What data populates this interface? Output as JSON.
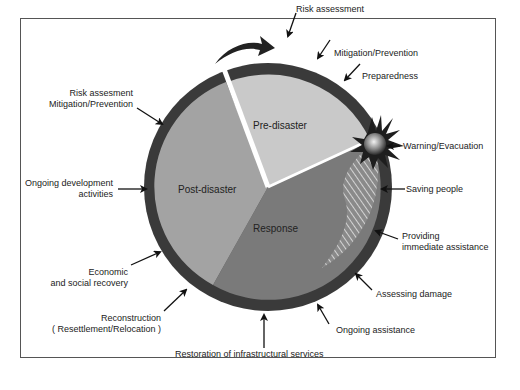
{
  "diagram": {
    "segments": [
      {
        "name": "pre-disaster",
        "label": "Pre-disaster",
        "color": "#c9c9c9"
      },
      {
        "name": "response",
        "label": "Response",
        "color": "#7a7a7a"
      },
      {
        "name": "post-disaster",
        "label": "Post-disaster",
        "color": "#a3a3a3"
      }
    ],
    "ring_color": "#3a3a3a",
    "labels": {
      "risk_assessment": "Risk assessment",
      "mitigation_prevention": "Mitigation/Prevention",
      "preparedness": "Preparedness",
      "warning_evacuation": "Warning/Evacuation",
      "saving_people": "Saving people",
      "providing_1": "Providing",
      "providing_2": "immediate assistance",
      "assessing_damage": "Assessing damage",
      "ongoing_assistance": "Ongoing assistance",
      "restoration": "Restoration of infrastructural services",
      "reconstruction_1": "Reconstruction",
      "reconstruction_2": "( Resettlement/Relocation )",
      "economic_1": "Economic",
      "economic_2": "and social recovery",
      "ongoing_dev_1": "Ongoing development",
      "ongoing_dev_2": "activities",
      "risk_assesment_left_1": "Risk assesment",
      "risk_assesment_left_2": "Mitigation/Prevention"
    }
  }
}
